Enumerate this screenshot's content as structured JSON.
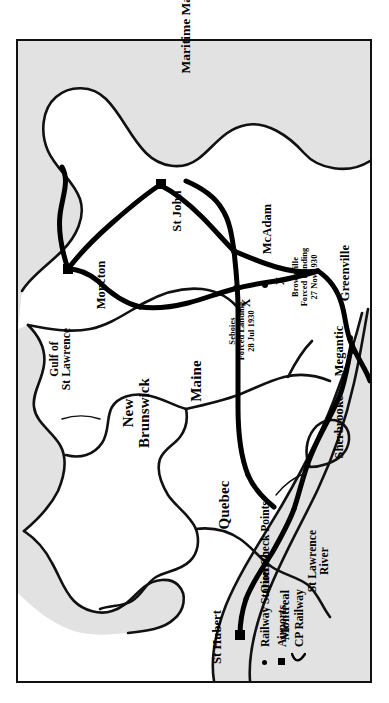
{
  "document": {
    "type": "map",
    "title": "Maritime Mail",
    "description": "Historical route map of the Maritime Mail air/rail service between St Hubert (Montreal) and Moncton, New Brunswick, showing railway station check points, airports, the CP Railway line and two forced-landing sites."
  },
  "colors": {
    "land": "#ffffff",
    "water": "#e2e2e2",
    "ink": "#111111",
    "route": "#000000",
    "border": "#111111",
    "page": "#ffffff"
  },
  "legend": {
    "items": [
      {
        "symbol": "dot",
        "label": "Railway Station Check Points"
      },
      {
        "symbol": "square",
        "label": "Airports"
      },
      {
        "symbol": "curve",
        "label": "CP Railway"
      }
    ]
  },
  "regions": [
    {
      "name": "New Brunswick",
      "line1": "New",
      "line2": "Brunswick"
    },
    {
      "name": "Maine",
      "line1": "Maine",
      "line2": ""
    },
    {
      "name": "Quebec",
      "line1": "Quebec",
      "line2": ""
    }
  ],
  "water_features": [
    {
      "name": "Gulf of St Lawrence",
      "line1": "Gulf of",
      "line2": "St Lawrence"
    },
    {
      "name": "St Lawrence River",
      "line1": "St Lawrence",
      "line2": "River"
    }
  ],
  "cities": [
    {
      "name": "Moncton",
      "marker": "airport"
    },
    {
      "name": "St John",
      "marker": "airport"
    },
    {
      "name": "McAdam",
      "marker": "station"
    },
    {
      "name": "Greenville",
      "marker": "station"
    },
    {
      "name": "Megantic",
      "marker": "station"
    },
    {
      "name": "Sherbrooke",
      "marker": "station"
    },
    {
      "name": "Quebec",
      "marker": "none"
    },
    {
      "name": "Montreal",
      "marker": "none"
    },
    {
      "name": "St Hubert",
      "marker": "airport"
    }
  ],
  "events": [
    {
      "name": "Seboies",
      "line1": "Seboies",
      "line2": "Forced Landing",
      "line3": "28 Jul 1930",
      "marker": "X"
    },
    {
      "name": "Brownville",
      "line1": "Brownville",
      "line2": "Forced Landing",
      "line3": "27 Nov 1930",
      "marker": "X"
    }
  ]
}
